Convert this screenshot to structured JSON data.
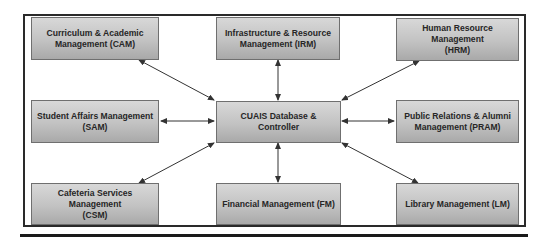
{
  "diagram": {
    "center": {
      "label": "CUAIS Database & Controller"
    },
    "modules": [
      {
        "id": "cam",
        "label": "Curriculum & Academic Management (CAM)",
        "line1": "Curriculum & Academic",
        "line2": "Management (CAM)"
      },
      {
        "id": "irm",
        "label": "Infrastructure & Resource Management (IRM)",
        "line1": "Infrastructure & Resource",
        "line2": "Management (IRM)"
      },
      {
        "id": "hrm",
        "label": "Human Resource Management (HRM)",
        "line1": "Human Resource Management",
        "line2": "(HRM)"
      },
      {
        "id": "sam",
        "label": "Student Affairs Management (SAM)",
        "line1": "Student Affairs Management",
        "line2": "(SAM)"
      },
      {
        "id": "pram",
        "label": "Public Relations & Alumni Management (PRAM)",
        "line1": "Public Relations & Alumni",
        "line2": "Management (PRAM)"
      },
      {
        "id": "csm",
        "label": "Cafeteria Services Management (CSM)",
        "line1": "Cafeteria Services Management",
        "line2": "(CSM)"
      },
      {
        "id": "fm",
        "label": "Financial Management (FM)",
        "line1": "Financial Management (FM)",
        "line2": ""
      },
      {
        "id": "lm",
        "label": "Library Management (LM)",
        "line1": "Library Management (LM)",
        "line2": ""
      }
    ],
    "connections": [
      {
        "from": "cam",
        "to": "center",
        "type": "bidirectional"
      },
      {
        "from": "irm",
        "to": "center",
        "type": "bidirectional"
      },
      {
        "from": "hrm",
        "to": "center",
        "type": "bidirectional"
      },
      {
        "from": "sam",
        "to": "center",
        "type": "bidirectional"
      },
      {
        "from": "pram",
        "to": "center",
        "type": "bidirectional"
      },
      {
        "from": "csm",
        "to": "center",
        "type": "bidirectional"
      },
      {
        "from": "fm",
        "to": "center",
        "type": "bidirectional"
      },
      {
        "from": "lm",
        "to": "center",
        "type": "bidirectional"
      }
    ]
  },
  "colors": {
    "box_top": "#d8d8d8",
    "box_bottom": "#a9a9a9",
    "box_border": "#6f6f6f",
    "text": "#262626",
    "arrow": "#333333",
    "frame": "#2a2a2a"
  }
}
